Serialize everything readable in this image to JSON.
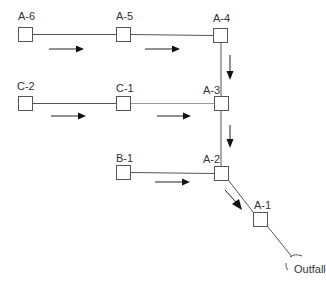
{
  "diagram": {
    "type": "sewer-network-schematic",
    "nodes": [
      {
        "id": "A-6",
        "label": "A-6",
        "x": 18,
        "y": 27
      },
      {
        "id": "A-5",
        "label": "A-5",
        "x": 116,
        "y": 27
      },
      {
        "id": "A-4",
        "label": "A-4",
        "x": 213,
        "y": 28
      },
      {
        "id": "C-2",
        "label": "C-2",
        "x": 18,
        "y": 96
      },
      {
        "id": "C-1",
        "label": "C-1",
        "x": 116,
        "y": 96
      },
      {
        "id": "A-3",
        "label": "A-3",
        "x": 214,
        "y": 96
      },
      {
        "id": "B-1",
        "label": "B-1",
        "x": 116,
        "y": 165
      },
      {
        "id": "A-2",
        "label": "A-2",
        "x": 214,
        "y": 166
      },
      {
        "id": "A-1",
        "label": "A-1",
        "x": 253,
        "y": 212
      }
    ],
    "outfall": {
      "label": "Outfall"
    },
    "pipes": [
      {
        "from": "A-6",
        "to": "A-5"
      },
      {
        "from": "A-5",
        "to": "A-4"
      },
      {
        "from": "C-2",
        "to": "C-1"
      },
      {
        "from": "C-1",
        "to": "A-3"
      },
      {
        "from": "A-4",
        "to": "A-3"
      },
      {
        "from": "A-3",
        "to": "A-2"
      },
      {
        "from": "B-1",
        "to": "A-2"
      },
      {
        "from": "A-2",
        "to": "A-1"
      },
      {
        "from": "A-1",
        "to": "Outfall"
      }
    ],
    "flow_direction": "toward Outfall"
  }
}
